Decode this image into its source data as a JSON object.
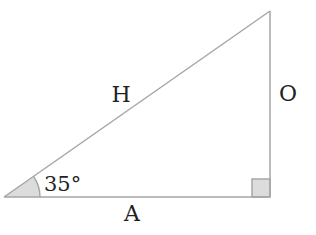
{
  "diagram": {
    "type": "right-triangle",
    "labels": {
      "hypotenuse": "H",
      "opposite": "O",
      "adjacent": "A",
      "angle": "35°"
    },
    "angle_degrees": 35,
    "colors": {
      "stroke": "#a6a6a6",
      "fill_marker": "#dcdcdc",
      "text": "#222222"
    }
  }
}
